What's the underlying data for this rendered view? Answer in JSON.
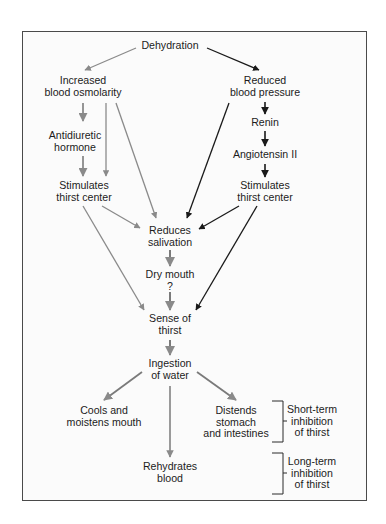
{
  "diagram": {
    "colors": {
      "osmolarity_pathway": "#8a8a8a",
      "pressure_pathway": "#1a1a1a",
      "common_pathway": "#7a7a7a",
      "frame_border": "#4a4a4a",
      "text": "#1c1c1c"
    },
    "nodes": {
      "dehydration": {
        "lines": [
          "Dehydration"
        ]
      },
      "osmolarity": {
        "lines": [
          "Increased",
          "blood osmolarity"
        ]
      },
      "pressure": {
        "lines": [
          "Reduced",
          "blood pressure"
        ]
      },
      "renin": {
        "lines": [
          "Renin"
        ]
      },
      "adh": {
        "lines": [
          "Antidiuretic",
          "hormone"
        ]
      },
      "angiotensin": {
        "lines": [
          "Angiotensin II"
        ]
      },
      "thirst_center_left": {
        "lines": [
          "Stimulates",
          "thirst center"
        ]
      },
      "thirst_center_right": {
        "lines": [
          "Stimulates",
          "thirst center"
        ]
      },
      "salivation": {
        "lines": [
          "Reduces",
          "salivation"
        ]
      },
      "dry_mouth": {
        "lines": [
          "Dry mouth",
          "?"
        ]
      },
      "sense_thirst": {
        "lines": [
          "Sense of",
          "thirst"
        ]
      },
      "ingestion": {
        "lines": [
          "Ingestion",
          "of water"
        ]
      },
      "cools": {
        "lines": [
          "Cools and",
          "moistens mouth"
        ]
      },
      "distends": {
        "lines": [
          "Distends",
          "stomach",
          "and intestines"
        ]
      },
      "rehydrates": {
        "lines": [
          "Rehydrates",
          "blood"
        ]
      },
      "short_term": {
        "lines": [
          "Short-term",
          "inhibition",
          "of thirst"
        ]
      },
      "long_term": {
        "lines": [
          "Long-term",
          "inhibition",
          "of thirst"
        ]
      }
    },
    "edges": [
      {
        "from": "dehydration",
        "to": "osmolarity",
        "color": "gray"
      },
      {
        "from": "dehydration",
        "to": "pressure",
        "color": "black"
      },
      {
        "from": "osmolarity",
        "to": "adh",
        "color": "gray"
      },
      {
        "from": "osmolarity",
        "to": "thirst_center_left",
        "color": "gray"
      },
      {
        "from": "osmolarity",
        "to": "salivation",
        "color": "gray"
      },
      {
        "from": "adh",
        "to": "thirst_center_left",
        "color": "gray"
      },
      {
        "from": "pressure",
        "to": "renin",
        "color": "black"
      },
      {
        "from": "pressure",
        "to": "salivation",
        "color": "black"
      },
      {
        "from": "renin",
        "to": "angiotensin",
        "color": "black"
      },
      {
        "from": "angiotensin",
        "to": "thirst_center_right",
        "color": "black"
      },
      {
        "from": "thirst_center_left",
        "to": "salivation",
        "color": "gray"
      },
      {
        "from": "thirst_center_left",
        "to": "sense_thirst",
        "color": "gray"
      },
      {
        "from": "thirst_center_right",
        "to": "salivation",
        "color": "black"
      },
      {
        "from": "thirst_center_right",
        "to": "sense_thirst",
        "color": "black"
      },
      {
        "from": "salivation",
        "to": "dry_mouth",
        "color": "gray"
      },
      {
        "from": "dry_mouth",
        "to": "sense_thirst",
        "color": "gray"
      },
      {
        "from": "sense_thirst",
        "to": "ingestion",
        "color": "gray"
      },
      {
        "from": "ingestion",
        "to": "cools",
        "color": "gray"
      },
      {
        "from": "ingestion",
        "to": "distends",
        "color": "gray"
      },
      {
        "from": "ingestion",
        "to": "rehydrates",
        "color": "gray"
      }
    ],
    "brackets": [
      {
        "groups": [
          "distends"
        ],
        "label": "short_term"
      },
      {
        "groups": [
          "rehydrates"
        ],
        "label": "long_term"
      }
    ]
  }
}
